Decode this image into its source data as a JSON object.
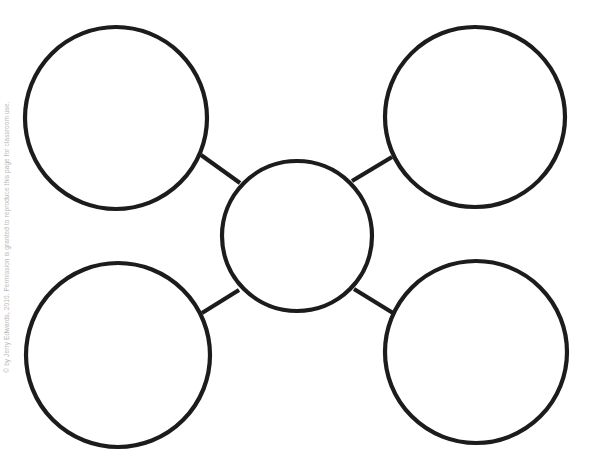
{
  "diagram": {
    "type": "bubble-map",
    "stroke_color": "#1c1c1c",
    "background": "#ffffff",
    "center_node": {
      "id": "center",
      "cx": 297,
      "cy": 236,
      "r": 75,
      "label": ""
    },
    "outer_nodes": [
      {
        "id": "top-left",
        "cx": 116,
        "cy": 118,
        "r": 91,
        "label": ""
      },
      {
        "id": "top-right",
        "cx": 475,
        "cy": 117,
        "r": 90,
        "label": ""
      },
      {
        "id": "bottom-left",
        "cx": 118,
        "cy": 355,
        "r": 92,
        "label": ""
      },
      {
        "id": "bottom-right",
        "cx": 476,
        "cy": 352,
        "r": 91,
        "label": ""
      }
    ],
    "connectors": [
      {
        "from": "center",
        "to": "top-left",
        "x1": 240,
        "y1": 183,
        "x2": 201,
        "y2": 155
      },
      {
        "from": "center",
        "to": "top-right",
        "x1": 352,
        "y1": 181,
        "x2": 392,
        "y2": 157
      },
      {
        "from": "center",
        "to": "bottom-left",
        "x1": 239,
        "y1": 290,
        "x2": 202,
        "y2": 313
      },
      {
        "from": "center",
        "to": "bottom-right",
        "x1": 354,
        "y1": 289,
        "x2": 393,
        "y2": 313
      }
    ]
  },
  "footer": {
    "copyright_text": "© by Jerry Edwards, 2010. Permission is granted to reproduce this page for classroom use."
  }
}
